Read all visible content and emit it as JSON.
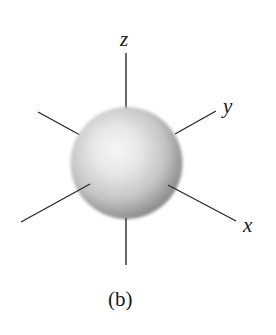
{
  "figure": {
    "caption": "(b)",
    "axes": {
      "z": {
        "label": "z"
      },
      "y": {
        "label": "y"
      },
      "x": {
        "label": "x"
      }
    },
    "colors": {
      "background": "#ffffff",
      "axis_line": "#2a2a2a",
      "sphere_highlight": "#f4f4f4",
      "sphere_mid": "#d2d2d2",
      "sphere_shadow": "#8c8c8c",
      "text": "#1a1a1a"
    }
  }
}
